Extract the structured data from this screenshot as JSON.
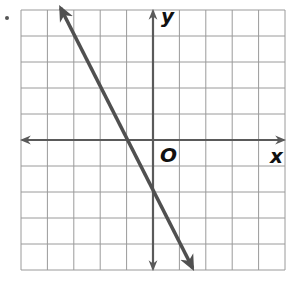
{
  "graph": {
    "x_label": "x",
    "y_label": "y",
    "origin_label": "O",
    "x_range": [
      -5,
      5
    ],
    "y_range": [
      -5,
      5
    ],
    "grid_step": 1,
    "colors": {
      "grid": "#9a9a9a",
      "axes": "#5a5a5a",
      "line": "#505050",
      "background": "#ffffff"
    }
  },
  "chart_data": {
    "type": "line",
    "title": "",
    "xlabel": "x",
    "ylabel": "y",
    "xlim": [
      -5,
      5
    ],
    "ylim": [
      -5,
      5
    ],
    "grid": true,
    "legend": "none",
    "series": [
      {
        "name": "line",
        "equation": "y = -2x - 2",
        "slope": -2,
        "y_intercept": -2,
        "x_intercept": -1,
        "x": [
          -3.5,
          -1,
          0,
          1.5
        ],
        "values": [
          5,
          0,
          -2,
          -5
        ],
        "arrows": "both ends"
      }
    ]
  }
}
